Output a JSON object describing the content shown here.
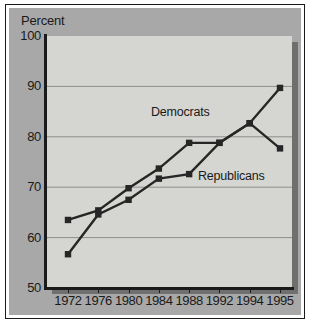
{
  "chart_data": {
    "type": "line",
    "title": "",
    "subtitle": "",
    "xlabel": "",
    "ylabel": "Percent",
    "ylim": [
      50,
      100
    ],
    "yticks": [
      50,
      60,
      70,
      80,
      90,
      100
    ],
    "ytick_labels": [
      "50",
      "60",
      "70",
      "80",
      "90",
      "100"
    ],
    "x": [
      1972,
      1976,
      1980,
      1984,
      1988,
      1992,
      1994,
      1995
    ],
    "xtick_labels": [
      "1972",
      "1976",
      "1980",
      "1984",
      "1988",
      "1992",
      "1994",
      "1995"
    ],
    "grid": "horizontal",
    "legend_position": "inline-annotation",
    "series": [
      {
        "name": "Democrats",
        "values": [
          56.7,
          64.6,
          67.5,
          71.7,
          72.6,
          78.8,
          82.7,
          89.7
        ],
        "color": "#262626",
        "marker": "square"
      },
      {
        "name": "Republicans",
        "values": [
          63.5,
          65.4,
          69.8,
          73.7,
          78.8,
          78.8,
          82.7,
          77.7
        ],
        "color": "#262626",
        "marker": "square"
      }
    ],
    "annotations": [
      {
        "text": "Democrats",
        "x": 1986,
        "y": 85
      },
      {
        "text": "Republicans",
        "x": 1991,
        "y": 74
      }
    ]
  },
  "figure": {
    "axis_title": "Percent",
    "series_label_democrats": "Democrats",
    "series_label_republicans": "Republicans",
    "colors": {
      "page_background": "#ffffff",
      "frame_field": "#a8a8a8",
      "plot_background": "#d5d5d2",
      "plot_shadow": "#6f6f6f",
      "axis": "#1a1a1a",
      "gridline": "#8e8e8e",
      "line": "#262626",
      "text": "#1a1a1a"
    }
  },
  "y_ticks": [
    {
      "label": "100",
      "value": 100
    },
    {
      "label": "90",
      "value": 90
    },
    {
      "label": "80",
      "value": 80
    },
    {
      "label": "70",
      "value": 70
    },
    {
      "label": "60",
      "value": 60
    },
    {
      "label": "50",
      "value": 50
    }
  ],
  "x_ticks": [
    {
      "label": "1972",
      "value": 1972
    },
    {
      "label": "1976",
      "value": 1976
    },
    {
      "label": "1980",
      "value": 1980
    },
    {
      "label": "1984",
      "value": 1984
    },
    {
      "label": "1988",
      "value": 1988
    },
    {
      "label": "1992",
      "value": 1992
    },
    {
      "label": "1994",
      "value": 1994
    },
    {
      "label": "1995",
      "value": 1995
    }
  ]
}
